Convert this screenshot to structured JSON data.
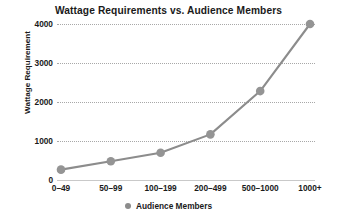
{
  "chart_data": {
    "type": "line",
    "title": "Wattage Requirements vs. Audience Members",
    "xlabel": "",
    "ylabel": "Wattage Requirement",
    "categories": [
      "0–49",
      "50–99",
      "100–199",
      "200–499",
      "500–1000",
      "1000+"
    ],
    "values": [
      265,
      480,
      700,
      1170,
      2280,
      4000
    ],
    "series": [
      {
        "name": "Audience Members",
        "values": [
          265,
          480,
          700,
          1170,
          2280,
          4000
        ]
      }
    ],
    "ylim": [
      0,
      4000
    ],
    "yticks": [
      0,
      1000,
      2000,
      3000,
      4000
    ],
    "ytick_labels": [
      "0",
      "1000",
      "2000",
      "3000",
      "4000"
    ],
    "grid": "horizontal-dotted",
    "legend_position": "bottom",
    "legend_entries": [
      "Audience Members"
    ],
    "marker": "circle",
    "colors": {
      "series_line": "#8c8c8c",
      "marker_fill": "#949494",
      "gridline": "#a8a8a8",
      "axis_line": "#c9c9c9",
      "text": "#1a1a1a",
      "background": "#ffffff"
    }
  },
  "legend": {
    "marker_icon": "circle-marker-icon",
    "label": "Audience Members"
  }
}
